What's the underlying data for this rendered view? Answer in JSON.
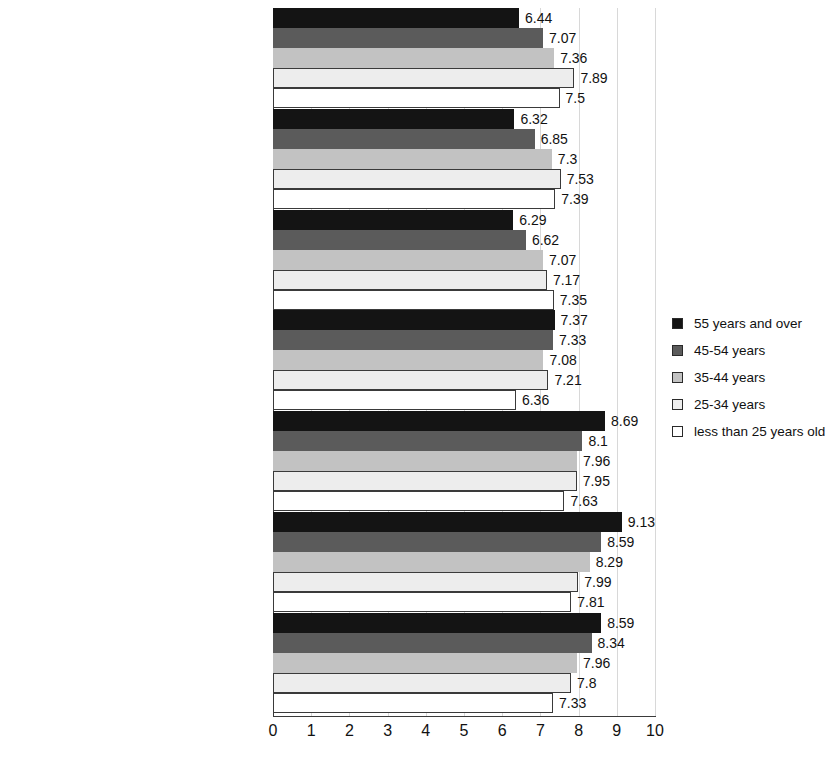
{
  "chart_data": {
    "type": "bar",
    "orientation": "horizontal",
    "title": "",
    "xlabel": "",
    "ylabel": "",
    "xlim": [
      0,
      10
    ],
    "xticks": [
      "0",
      "1",
      "2",
      "3",
      "4",
      "5",
      "6",
      "7",
      "8",
      "9",
      "10"
    ],
    "grid": true,
    "legend_position": "right",
    "categories": [
      "New qualifications",
      "Changing the workplace",
      "Part-time work",
      "Consulting employees",
      "Ensuring safety and health protection",
      "Periodic medical examinations",
      "Health promotion"
    ],
    "series": [
      {
        "name": "55 years and over",
        "color": "#141414",
        "values": [
          6.44,
          6.32,
          6.29,
          7.37,
          8.69,
          9.13,
          8.59
        ],
        "labels": [
          "6.44",
          "6.32",
          "6.29",
          "7.37",
          "8.69",
          "9.13",
          "8.59"
        ]
      },
      {
        "name": "45-54 years",
        "color": "#5b5b5b",
        "values": [
          7.07,
          6.85,
          6.62,
          7.33,
          8.1,
          8.59,
          8.34
        ],
        "labels": [
          "7.07",
          "6.85",
          "6.62",
          "7.33",
          "8.1",
          "8.59",
          "8.34"
        ]
      },
      {
        "name": "35-44 years",
        "color": "#c2c2c2",
        "values": [
          7.36,
          7.3,
          7.07,
          7.08,
          7.96,
          8.29,
          7.96
        ],
        "labels": [
          "7.36",
          "7.3",
          "7.07",
          "7.08",
          "7.96",
          "8.29",
          "7.96"
        ]
      },
      {
        "name": "25-34 years",
        "color": "#ededed",
        "values": [
          7.89,
          7.53,
          7.17,
          7.21,
          7.95,
          7.99,
          7.8
        ],
        "labels": [
          "7.89",
          "7.53",
          "7.17",
          "7.21",
          "7.95",
          "7.99",
          "7.8"
        ]
      },
      {
        "name": "less than 25 years old",
        "color": "#ffffff",
        "values": [
          7.5,
          7.39,
          7.35,
          6.36,
          7.63,
          7.81,
          7.33
        ],
        "labels": [
          "7.5",
          "7.39",
          "7.35",
          "6.36",
          "7.63",
          "7.81",
          "7.33"
        ]
      }
    ]
  },
  "legend": {
    "items": [
      {
        "label": "55 years and over",
        "color": "#141414"
      },
      {
        "label": "45-54 years",
        "color": "#5b5b5b"
      },
      {
        "label": "35-44 years",
        "color": "#c2c2c2"
      },
      {
        "label": "25-34 years",
        "color": "#ededed"
      },
      {
        "label": "less than 25 years old",
        "color": "#ffffff"
      }
    ]
  }
}
